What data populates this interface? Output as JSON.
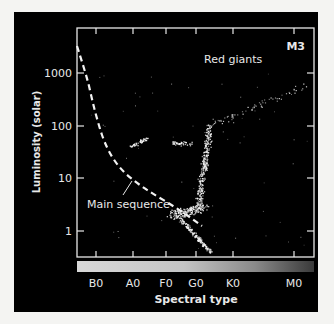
{
  "chart_data": {
    "type": "scatter",
    "title": "M3",
    "xlabel": "Spectral type",
    "ylabel": "Luminosity (solar)",
    "x_ticks": [
      "B0",
      "A0",
      "F0",
      "G0",
      "K0",
      "M0"
    ],
    "y_ticks": [
      "1000",
      "100",
      "10",
      "1"
    ],
    "y_scale": "log",
    "ylim": [
      0.3,
      6000
    ],
    "annotations": [
      "Red giants",
      "Main sequence"
    ],
    "colors": {
      "background": "#000000",
      "frame": "#e8e8e8",
      "points": "#ffffff"
    },
    "series": [
      {
        "name": "Main sequence (reference curve, dashed)",
        "points": [
          {
            "x": "B0-",
            "y": 3000
          },
          {
            "x": "B0",
            "y": 700
          },
          {
            "x": "A0-",
            "y": 90
          },
          {
            "x": "A0",
            "y": 15
          },
          {
            "x": "F0",
            "y": 4
          },
          {
            "x": "G0-",
            "y": 2
          },
          {
            "x": "G0",
            "y": 1
          }
        ]
      },
      {
        "name": "M3 stars (clusters)",
        "groups": [
          {
            "label": "horizontal branch (blue)",
            "x_range": [
              "A0",
              "F0"
            ],
            "y_approx": 40
          },
          {
            "label": "horizontal branch (red)",
            "x_range": [
              "F0",
              "G0"
            ],
            "y_approx": 45
          },
          {
            "label": "red giant branch",
            "x_range": [
              "G0",
              "M0"
            ],
            "y_range": [
              3,
              500
            ]
          },
          {
            "label": "main sequence turnoff",
            "x_range": [
              "F0",
              "G0"
            ],
            "y_range": [
              0.4,
              4
            ]
          }
        ]
      }
    ]
  }
}
